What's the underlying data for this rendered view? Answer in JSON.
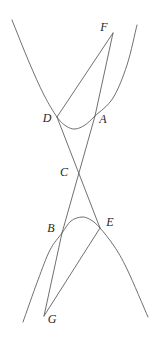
{
  "figure": {
    "background": "#ffffff",
    "stroke_color": "#606060",
    "stroke_width": 0.9,
    "label_color": "#262626",
    "width": 155,
    "height": 337,
    "points": {
      "F": [
        113,
        33
      ],
      "D": [
        57,
        117
      ],
      "A": [
        95,
        116
      ],
      "C": [
        75,
        173
      ],
      "B": [
        62,
        233
      ],
      "E": [
        100,
        228
      ],
      "G": [
        44,
        316
      ]
    },
    "labels": [
      {
        "text": "F",
        "x": 104,
        "y": 27
      },
      {
        "text": "D",
        "x": 47,
        "y": 118
      },
      {
        "text": "A",
        "x": 103,
        "y": 119
      },
      {
        "text": "C",
        "x": 64,
        "y": 172
      },
      {
        "text": "B",
        "x": 51,
        "y": 228
      },
      {
        "text": "E",
        "x": 110,
        "y": 222
      },
      {
        "text": "G",
        "x": 52,
        "y": 319
      }
    ],
    "segments": [
      {
        "name": "segment-F-D",
        "from": "F",
        "to": "D"
      },
      {
        "name": "segment-F-A",
        "from": "F",
        "to": "A"
      },
      {
        "name": "segment-D-E",
        "from": "D",
        "to": "E"
      },
      {
        "name": "segment-A-B",
        "from": "A",
        "to": "B"
      },
      {
        "name": "segment-G-B",
        "from": "G",
        "to": "B"
      },
      {
        "name": "segment-G-E",
        "from": "G",
        "to": "E"
      }
    ],
    "curves": [
      {
        "name": "hyperbola-upper-branch",
        "points": [
          [
            12,
            20
          ],
          [
            29,
            62
          ],
          [
            44,
            95
          ],
          [
            57,
            117
          ],
          [
            66,
            126
          ],
          [
            75,
            129
          ],
          [
            85,
            125
          ],
          [
            95,
            116
          ],
          [
            113,
            98
          ],
          [
            127,
            65
          ],
          [
            137,
            25
          ]
        ]
      },
      {
        "name": "hyperbola-lower-branch",
        "points": [
          [
            23,
            322
          ],
          [
            38,
            280
          ],
          [
            50,
            250
          ],
          [
            62,
            233
          ],
          [
            71,
            221
          ],
          [
            82,
            217
          ],
          [
            91,
            220
          ],
          [
            100,
            228
          ],
          [
            114,
            246
          ],
          [
            127,
            269
          ],
          [
            148,
            317
          ]
        ]
      }
    ]
  }
}
